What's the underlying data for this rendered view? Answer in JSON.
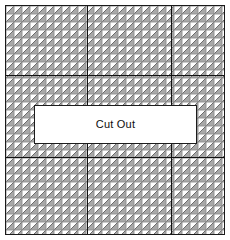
{
  "diagram": {
    "title": "Cut Out",
    "type": "mesh-plate-with-cutout",
    "canvas": {
      "width": 230,
      "height": 240,
      "background": "#ffffff"
    },
    "plate": {
      "x": 5,
      "y": 5,
      "width": 220,
      "height": 230,
      "border_color": "#1a1a1a",
      "border_width": 1,
      "fill": "#ffffff"
    },
    "mesh": {
      "pattern": "diagonal-hatched-squares",
      "cell_size": 8,
      "cell_fill": "#ffffff",
      "hatch_fill": "#a8a8a8",
      "cell_stroke": "#8f8f8f",
      "diagonal_stroke": "#6e6e6e",
      "columns": 27,
      "rows": 29
    },
    "dividers": {
      "color": "#121212",
      "vertical_x": [
        86,
        170
      ],
      "horizontal_y": [
        74,
        156
      ]
    },
    "cutout": {
      "label": "Cut Out",
      "x": 33,
      "y": 104,
      "width": 163,
      "height": 39,
      "fill": "#ffffff",
      "border_color": "#1d1d1d",
      "border_width": 1,
      "text_color": "#0d0d0d",
      "font_size": 11
    }
  }
}
